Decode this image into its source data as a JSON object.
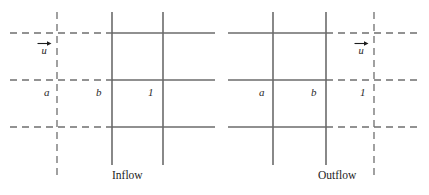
{
  "figure": {
    "background_color": "#ffffff",
    "solid_line_color": "#6b6b6b",
    "dashed_line_color": "#6f6f6f",
    "text_color": "#1d1d1d"
  },
  "panels": [
    {
      "id": "inflow",
      "caption": "Inflow",
      "velocity": {
        "label": "u",
        "arrow_direction": "right",
        "arrow_icon": "right-arrow-icon"
      },
      "node_labels": [
        {
          "text": "a",
          "role": "ghost-cell-node"
        },
        {
          "text": "b",
          "role": "boundary-node"
        },
        {
          "text": "1",
          "role": "first-interior-node"
        }
      ]
    },
    {
      "id": "outflow",
      "caption": "Outflow",
      "velocity": {
        "label": "u",
        "arrow_direction": "right",
        "arrow_icon": "right-arrow-icon"
      },
      "node_labels": [
        {
          "text": "a",
          "role": "interior-node"
        },
        {
          "text": "b",
          "role": "boundary-node"
        },
        {
          "text": "1",
          "role": "ghost-cell-node"
        }
      ]
    }
  ]
}
